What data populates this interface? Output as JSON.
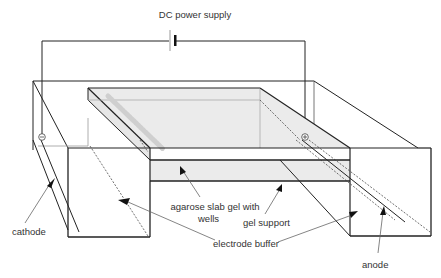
{
  "diagram": {
    "labels": {
      "power_supply": "DC power supply",
      "cathode": "cathode",
      "anode": "anode",
      "gel_line1": "agarose slab gel with",
      "gel_line2": "wells",
      "gel_support": "gel support",
      "electrode_buffer": "electrode buffer"
    },
    "symbols": {
      "cathode_sign": "⊖",
      "anode_sign": "⊕"
    },
    "colors": {
      "line": "#222222",
      "gel_fill": "#ebebeb",
      "wells": "#c8c8c8",
      "pointer": "#555555",
      "text": "#333333"
    }
  }
}
